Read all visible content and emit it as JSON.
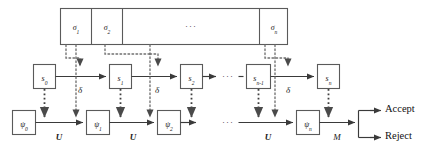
{
  "figure": {
    "type": "block-flow-diagram"
  },
  "colors": {
    "solid_line": "#3a3a3a",
    "dotted_line": "#6f6f6f",
    "box_border": "#5a5a5a",
    "text": "#1a1a1a",
    "background": "#ffffff"
  },
  "tape": {
    "name": "input-tape",
    "cells": [
      {
        "base": "σ",
        "sub": "1",
        "kind": "symbol"
      },
      {
        "base": "σ",
        "sub": "2",
        "kind": "symbol"
      },
      {
        "base": "···",
        "sub": "",
        "kind": "ellipsis"
      },
      {
        "base": "σ",
        "sub": "n",
        "kind": "symbol"
      }
    ]
  },
  "state_row": {
    "label": "machine-state-sequence",
    "boxes": [
      {
        "base": "s",
        "sub": "0"
      },
      {
        "base": "s",
        "sub": "1"
      },
      {
        "base": "s",
        "sub": "2"
      },
      {
        "base": "s",
        "sub": "n-1"
      },
      {
        "base": "s",
        "sub": "n"
      }
    ],
    "transition_label": "δ",
    "transition_count": 3,
    "ellipsis": "···"
  },
  "register_row": {
    "label": "quantum-register-sequence",
    "boxes": [
      {
        "base": "ψ",
        "sub": "0"
      },
      {
        "base": "ψ",
        "sub": "1"
      },
      {
        "base": "ψ",
        "sub": "2"
      },
      {
        "base": "ψ",
        "sub": "n"
      }
    ],
    "unitary_label": "U",
    "unitary_count": 3,
    "measurement_label": "M",
    "ellipsis": "···"
  },
  "outcomes": {
    "accept": "Accept",
    "reject": "Reject"
  }
}
